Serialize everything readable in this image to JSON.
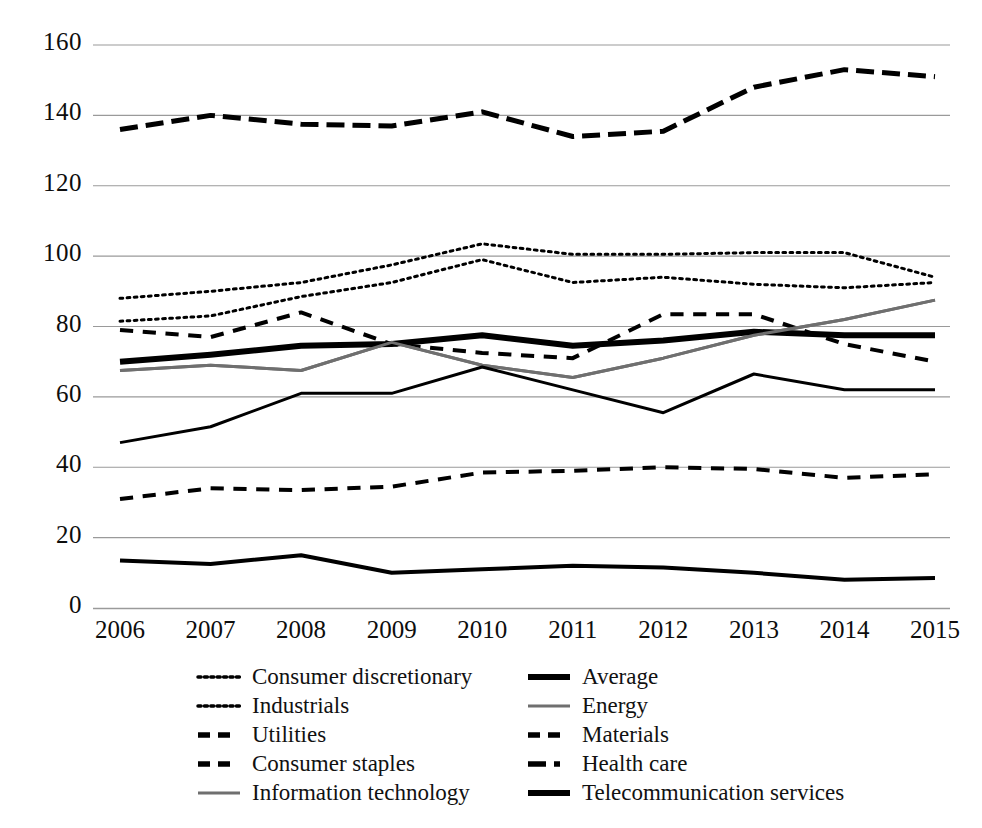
{
  "chart_data": {
    "type": "line",
    "title": "",
    "subtitle": "",
    "xlabel": "",
    "ylabel": "",
    "x": [
      2006,
      2007,
      2008,
      2009,
      2010,
      2011,
      2012,
      2013,
      2014,
      2015
    ],
    "categories": [
      "2006",
      "2007",
      "2008",
      "2009",
      "2010",
      "2011",
      "2012",
      "2013",
      "2014",
      "2015"
    ],
    "xtick_labels": [
      "2006",
      "2007",
      "2008",
      "2009",
      "2010",
      "2011",
      "2012",
      "2013",
      "2014",
      "2015"
    ],
    "ytick_labels": [
      "0",
      "20",
      "40",
      "60",
      "80",
      "100",
      "120",
      "140",
      "160"
    ],
    "yticks": [
      0,
      20,
      40,
      60,
      80,
      100,
      120,
      140,
      160
    ],
    "ylim": [
      0,
      160
    ],
    "grid": "horizontal",
    "legend_position": "below",
    "legend_columns": 2,
    "series": [
      {
        "name": "Consumer discretionary",
        "style": "dotted",
        "color": "#000000",
        "width": 3,
        "values": [
          88,
          90,
          92.5,
          97.5,
          103.5,
          100.5,
          100.5,
          101,
          101,
          94
        ]
      },
      {
        "name": "Industrials",
        "style": "dotted",
        "color": "#000000",
        "width": 3,
        "values": [
          81.5,
          83,
          88.5,
          92.5,
          99,
          92.5,
          94,
          92,
          91,
          92.5
        ]
      },
      {
        "name": "Utilities",
        "style": "dashed",
        "color": "#000000",
        "width": 4,
        "values": [
          31,
          34,
          33.5,
          34.5,
          38.5,
          39,
          40,
          39.5,
          37,
          38
        ]
      },
      {
        "name": "Consumer staples",
        "style": "dashed",
        "color": "#000000",
        "width": 4,
        "values": [
          79,
          77,
          84,
          75,
          72.5,
          71,
          83.5,
          83.5,
          75,
          70
        ]
      },
      {
        "name": "Information technology",
        "style": "solid",
        "color": "#6f6f6f",
        "width": 3,
        "values": [
          67.5,
          69,
          67.5,
          75.5,
          69,
          65.5,
          71,
          77.5,
          82,
          87.5
        ]
      },
      {
        "name": "Average",
        "style": "solid",
        "color": "#000000",
        "width": 6,
        "values": [
          70,
          72,
          74.5,
          75,
          77.5,
          74.5,
          76,
          78.5,
          77.5,
          77.5
        ]
      },
      {
        "name": "Energy",
        "style": "solid",
        "color": "#6f6f6f",
        "width": 3,
        "values": [
          67.5,
          69,
          67.5,
          75.5,
          69,
          65.5,
          71,
          77.5,
          82,
          87.5
        ]
      },
      {
        "name": "Materials",
        "style": "solid",
        "color": "#000000",
        "width": 3,
        "values": [
          47,
          51.5,
          61,
          61,
          68.5,
          62,
          55.5,
          66.5,
          62,
          62
        ]
      },
      {
        "name": "Health care",
        "style": "dash-dot",
        "color": "#000000",
        "width": 5,
        "values": [
          136,
          140,
          137.5,
          137,
          141,
          134,
          135.5,
          148,
          153,
          151
        ]
      },
      {
        "name": "Telecommunication services",
        "style": "solid",
        "color": "#000000",
        "width": 4,
        "values": [
          13.5,
          12.5,
          15,
          10,
          11,
          12,
          11.5,
          10,
          8,
          8.5
        ]
      }
    ]
  },
  "axes": {
    "y_labels": [
      {
        "value": 160,
        "text": "160"
      },
      {
        "value": 140,
        "text": "140"
      },
      {
        "value": 120,
        "text": "120"
      },
      {
        "value": 100,
        "text": "100"
      },
      {
        "value": 80,
        "text": "80"
      },
      {
        "value": 60,
        "text": "60"
      },
      {
        "value": 40,
        "text": "40"
      },
      {
        "value": 20,
        "text": "20"
      },
      {
        "value": 0,
        "text": "0"
      }
    ],
    "x_labels": [
      "2006",
      "2007",
      "2008",
      "2009",
      "2010",
      "2011",
      "2012",
      "2013",
      "2014",
      "2015"
    ]
  },
  "legend": {
    "column_left": [
      {
        "label": "Consumer discretionary",
        "style": "dotted",
        "color": "#000000"
      },
      {
        "label": "Industrials",
        "style": "dotted",
        "color": "#000000"
      },
      {
        "label": "Utilities",
        "style": "dashed",
        "color": "#000000"
      },
      {
        "label": "Consumer staples",
        "style": "dashed",
        "color": "#000000"
      },
      {
        "label": "Information technology",
        "style": "solid",
        "color": "#6f6f6f"
      }
    ],
    "column_right": [
      {
        "label": "Average",
        "style": "solid",
        "color": "#000000"
      },
      {
        "label": "Energy",
        "style": "solid",
        "color": "#6f6f6f"
      },
      {
        "label": "Materials",
        "style": "dashed",
        "color": "#000000"
      },
      {
        "label": "Health care",
        "style": "dash-dot",
        "color": "#000000"
      },
      {
        "label": "Telecommunication services",
        "style": "solid",
        "color": "#000000"
      }
    ]
  },
  "colors": {
    "gridline": "#9a9a9a",
    "black_series": "#000000",
    "gray_series": "#6f6f6f",
    "background": "#ffffff"
  }
}
